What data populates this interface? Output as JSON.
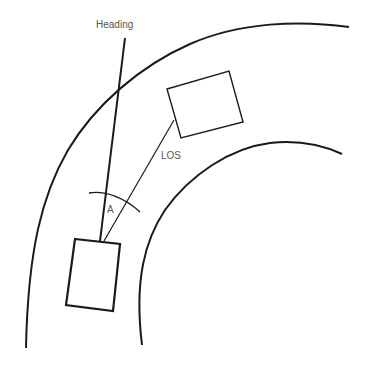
{
  "diagram": {
    "labels": {
      "heading": "Heading",
      "los": "LOS",
      "angle": "A"
    },
    "colors": {
      "stroke": "#1a1a1a",
      "text": "#555555",
      "background": "#ffffff"
    },
    "elements": [
      {
        "id": "outer-road-edge",
        "type": "curve"
      },
      {
        "id": "inner-road-edge",
        "type": "curve"
      },
      {
        "id": "own-vehicle",
        "type": "rectangle"
      },
      {
        "id": "target-vehicle",
        "type": "rectangle"
      },
      {
        "id": "heading-line",
        "type": "line"
      },
      {
        "id": "los-line",
        "type": "line"
      },
      {
        "id": "angle-arc",
        "type": "arc"
      }
    ]
  }
}
